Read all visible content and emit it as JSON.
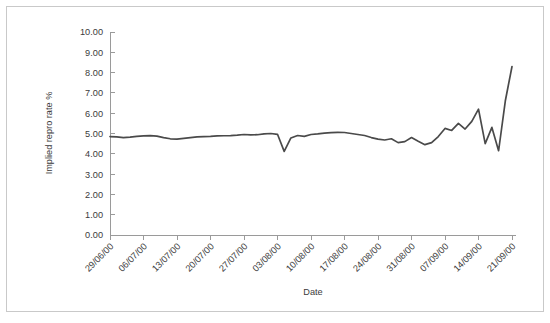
{
  "chart_data": {
    "type": "line",
    "title": "",
    "xlabel": "Date",
    "ylabel": "Implied repro rate %",
    "ylim": [
      0,
      10
    ],
    "ytick_labels": [
      "0.00",
      "1.00",
      "2.00",
      "3.00",
      "4.00",
      "5.00",
      "6.00",
      "7.00",
      "8.00",
      "9.00",
      "10.00"
    ],
    "ytick_values": [
      0,
      1,
      2,
      3,
      4,
      5,
      6,
      7,
      8,
      9,
      10
    ],
    "xtick_labels": [
      "29/06/00",
      "06/07/00",
      "13/07/00",
      "20/07/00",
      "27/07/00",
      "03/08/00",
      "10/08/00",
      "17/08/00",
      "24/08/00",
      "31/08/00",
      "07/09/00",
      "14/09/00",
      "21/09/00"
    ],
    "xtick_index": [
      0,
      5,
      10,
      15,
      20,
      25,
      30,
      35,
      40,
      45,
      50,
      55,
      60
    ],
    "grid": false,
    "legend": "none",
    "series": [
      {
        "name": "Implied repro rate %",
        "color": "#4a4a4a",
        "x": [
          0,
          1,
          2,
          3,
          4,
          5,
          6,
          7,
          8,
          9,
          10,
          11,
          12,
          13,
          14,
          15,
          16,
          17,
          18,
          19,
          20,
          21,
          22,
          23,
          24,
          25,
          26,
          27,
          28,
          29,
          30,
          31,
          32,
          33,
          34,
          35,
          36,
          37,
          38,
          39,
          40,
          41,
          42,
          43,
          44,
          45,
          46,
          47,
          48,
          49,
          50,
          51,
          52,
          53,
          54,
          55,
          56,
          57,
          58,
          59,
          60
        ],
        "values": [
          4.85,
          4.83,
          4.8,
          4.82,
          4.86,
          4.88,
          4.9,
          4.87,
          4.8,
          4.74,
          4.72,
          4.76,
          4.8,
          4.83,
          4.85,
          4.86,
          4.88,
          4.89,
          4.9,
          4.92,
          4.95,
          4.93,
          4.94,
          4.98,
          5.0,
          4.96,
          4.12,
          4.78,
          4.9,
          4.86,
          4.95,
          4.98,
          5.02,
          5.04,
          5.06,
          5.05,
          5.0,
          4.95,
          4.9,
          4.8,
          4.72,
          4.68,
          4.74,
          4.55,
          4.6,
          4.8,
          4.62,
          4.45,
          4.55,
          4.85,
          5.25,
          5.15,
          5.5,
          5.22,
          5.6,
          6.2,
          4.5,
          5.3,
          4.15,
          6.6,
          8.3
        ]
      }
    ]
  },
  "axes": {
    "y_axis_title": "Implied repro rate %",
    "x_axis_title": "Date"
  }
}
